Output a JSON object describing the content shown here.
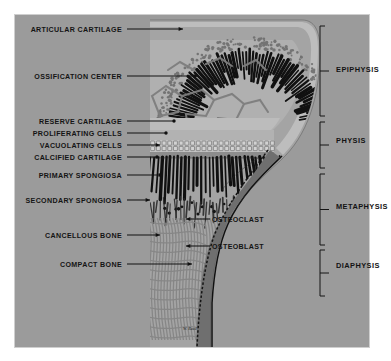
{
  "figure": {
    "frame": {
      "x": 14,
      "y": 14,
      "width": 356,
      "height": 334
    },
    "background_color": "#9b9b9b",
    "outer_background_color": "#ffffff",
    "signature": "W. Reed"
  },
  "left_labels": [
    {
      "text": "ARTICULAR CARTILAGE",
      "text_x": 122,
      "text_y": 32,
      "leader_from_x": 127,
      "leader_to_x": 183,
      "leader_y": 29,
      "tip": "arrow"
    },
    {
      "text": "OSSIFICATION CENTER",
      "text_x": 122,
      "text_y": 79,
      "leader_from_x": 127,
      "leader_to_x": 198,
      "leader_y": 76,
      "tip": "arrow"
    },
    {
      "text": "RESERVE CARTILAGE",
      "text_x": 122,
      "text_y": 124,
      "leader_from_x": 127,
      "leader_to_x": 174,
      "leader_y": 121,
      "tip": "dot"
    },
    {
      "text": "PROLIFERATING CELLS",
      "text_x": 122,
      "text_y": 136,
      "leader_from_x": 127,
      "leader_to_x": 166,
      "leader_y": 133,
      "tip": "dot"
    },
    {
      "text": "VACUOLATING CELLS",
      "text_x": 122,
      "text_y": 148,
      "leader_from_x": 127,
      "leader_to_x": 160,
      "leader_y": 145,
      "tip": "arrow"
    },
    {
      "text": "CALCIFIED CARTILAGE",
      "text_x": 122,
      "text_y": 160,
      "leader_from_x": 127,
      "leader_to_x": 157,
      "leader_y": 157,
      "tip": "dot"
    },
    {
      "text": "PRIMARY SPONGIOSA",
      "text_x": 122,
      "text_y": 178,
      "leader_from_x": 127,
      "leader_to_x": 163,
      "leader_y": 175,
      "tip": "arrow"
    },
    {
      "text": "SECONDARY SPONGIOSA",
      "text_x": 122,
      "text_y": 203,
      "leader_from_x": 127,
      "leader_to_x": 150,
      "leader_y": 200,
      "tip": "arrow"
    },
    {
      "text": "CANCELLOUS BONE",
      "text_x": 122,
      "text_y": 238,
      "leader_from_x": 127,
      "leader_to_x": 160,
      "leader_y": 235,
      "tip": "arrow"
    },
    {
      "text": "COMPACT BONE",
      "text_x": 122,
      "text_y": 267,
      "leader_from_x": 127,
      "leader_to_x": 192,
      "leader_y": 264,
      "tip": "arrow"
    }
  ],
  "inner_labels": [
    {
      "text": "OSTEOCLAST",
      "text_x": 212,
      "text_y": 222,
      "leader_from_x": 210,
      "leader_to_x": 186,
      "leader_y": 219,
      "tip": "arrow"
    },
    {
      "text": "OSTEOBLAST",
      "text_x": 212,
      "text_y": 249,
      "leader_from_x": 210,
      "leader_to_x": 186,
      "leader_y": 246,
      "tip": "arrow"
    }
  ],
  "right_brackets": [
    {
      "label": "EPIPHYSIS",
      "label_x": 336,
      "label_y": 72,
      "bracket_x": 320,
      "top": 26,
      "bottom": 116,
      "tick_x": 327
    },
    {
      "label": "PHYSIS",
      "label_x": 336,
      "label_y": 143,
      "bracket_x": 320,
      "top": 122,
      "bottom": 168,
      "tick_x": 327
    },
    {
      "label": "METAPHYSIS",
      "label_x": 336,
      "label_y": 209,
      "bracket_x": 320,
      "top": 174,
      "bottom": 245,
      "tick_x": 327
    },
    {
      "label": "DIAPHYSIS",
      "label_x": 336,
      "label_y": 268,
      "bracket_x": 320,
      "top": 250,
      "bottom": 296,
      "tick_x": 327
    }
  ],
  "colors": {
    "plate_background": "#9b9b9b",
    "cartilage_light": "#b4b4b4",
    "marrow": "#a8a8a8",
    "spicule_dark": "#131313",
    "cortex": "#6e6e6e",
    "trabecula": "#8e8e8e",
    "label_text": "#141414"
  }
}
